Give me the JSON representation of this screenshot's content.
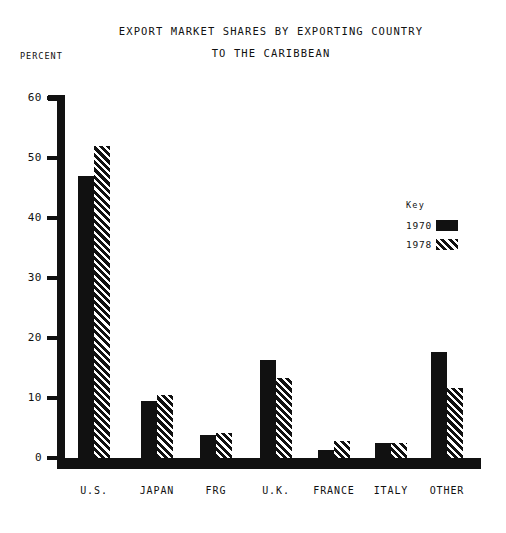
{
  "titles": {
    "line1": "Export Market Shares by Exporting Country",
    "line2": "to the Caribbean",
    "axis_unit": "Percent"
  },
  "legend": {
    "heading": "Key",
    "entries": [
      {
        "label": "1970",
        "pattern": "solid"
      },
      {
        "label": "1978",
        "pattern": "hatch"
      }
    ]
  },
  "axis": {
    "ticks": [
      "0",
      "10",
      "20",
      "30",
      "40",
      "50",
      "60"
    ]
  },
  "chart_data": {
    "type": "bar",
    "title": "Export Market Shares by Exporting Country to the Caribbean",
    "xlabel": "",
    "ylabel": "Percent",
    "ylim": [
      0,
      60
    ],
    "ytick_step": 10,
    "grid": false,
    "legend_position": "right",
    "categories": [
      "U.S.",
      "Japan",
      "FRG",
      "U.K.",
      "France",
      "Italy",
      "Other"
    ],
    "series": [
      {
        "name": "1970",
        "pattern": "solid",
        "values": [
          47,
          9.5,
          3.9,
          16.3,
          1.3,
          2.5,
          17.7
        ]
      },
      {
        "name": "1978",
        "pattern": "hatch",
        "values": [
          52,
          10.5,
          4.1,
          13.3,
          2.8,
          2.5,
          11.7
        ]
      }
    ]
  }
}
